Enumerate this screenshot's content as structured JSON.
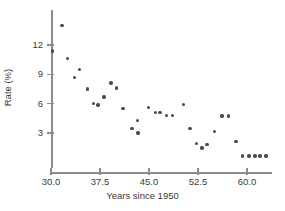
{
  "chart_data": {
    "type": "scatter",
    "title": "",
    "xlabel": "Years since 1950",
    "ylabel": "Rate (%)",
    "xlim": [
      28.5,
      63.8
    ],
    "ylim": [
      0.0,
      14.8
    ],
    "grid": false,
    "legend": null,
    "xticks": [
      30.0,
      37.5,
      45.0,
      52.5,
      60.0
    ],
    "xtick_labels": [
      "30.0",
      "37.5",
      "45.0",
      "52.5",
      "60.0"
    ],
    "yticks": [
      3,
      6,
      9,
      12
    ],
    "ytick_labels": [
      "3",
      "6",
      "9",
      "12"
    ],
    "marker": "filled-circle",
    "marker_color": "#4a4a52",
    "axis_color": "#8c8c8c",
    "points": [
      {
        "x": 30.2,
        "y": 11.4
      },
      {
        "x": 31.7,
        "y": 14.0
      },
      {
        "x": 32.5,
        "y": 10.6
      },
      {
        "x": 33.6,
        "y": 8.7
      },
      {
        "x": 34.4,
        "y": 9.5
      },
      {
        "x": 35.6,
        "y": 7.5
      },
      {
        "x": 36.5,
        "y": 6.0
      },
      {
        "x": 37.2,
        "y": 5.85
      },
      {
        "x": 38.1,
        "y": 6.7
      },
      {
        "x": 39.2,
        "y": 8.1
      },
      {
        "x": 40.0,
        "y": 7.6
      },
      {
        "x": 41.0,
        "y": 5.5
      },
      {
        "x": 42.4,
        "y": 3.45
      },
      {
        "x": 43.2,
        "y": 4.3
      },
      {
        "x": 43.3,
        "y": 3.0
      },
      {
        "x": 44.9,
        "y": 5.6
      },
      {
        "x": 46.0,
        "y": 5.1
      },
      {
        "x": 46.7,
        "y": 5.1
      },
      {
        "x": 47.7,
        "y": 4.8
      },
      {
        "x": 48.6,
        "y": 4.8
      },
      {
        "x": 50.3,
        "y": 5.9
      },
      {
        "x": 51.3,
        "y": 3.45
      },
      {
        "x": 52.3,
        "y": 1.9
      },
      {
        "x": 53.1,
        "y": 1.45
      },
      {
        "x": 53.9,
        "y": 1.85
      },
      {
        "x": 55.0,
        "y": 3.15
      },
      {
        "x": 56.2,
        "y": 4.75
      },
      {
        "x": 57.2,
        "y": 4.75
      },
      {
        "x": 58.3,
        "y": 2.1
      },
      {
        "x": 59.3,
        "y": 0.65
      },
      {
        "x": 60.3,
        "y": 0.65
      },
      {
        "x": 61.2,
        "y": 0.65
      },
      {
        "x": 62.0,
        "y": 0.65
      },
      {
        "x": 62.9,
        "y": 0.65
      }
    ]
  }
}
